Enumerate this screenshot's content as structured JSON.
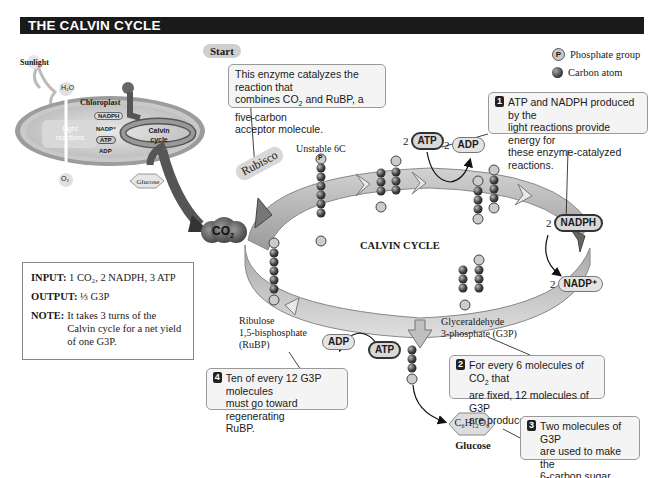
{
  "header": {
    "title": "THE CALVIN CYCLE"
  },
  "legend": {
    "items": [
      {
        "symbol": "P",
        "label": "Phosphate group"
      },
      {
        "symbol": "",
        "label": "Carbon atom"
      }
    ]
  },
  "start_label": "Start",
  "rubisco_label": "Rubisco",
  "center_label": "CALVIN CYCLE",
  "co2_label": "CO",
  "co2_sub": "2",
  "chloroplast_inset": {
    "sunlight": "Sunlight",
    "h2o": "H₂O",
    "o2": "O₂",
    "chloroplast": "Chloroplast",
    "light_reactions": "Light reactions",
    "calvin_cycle": "Calvin cycle",
    "nadph": "NADPH",
    "nadp": "NADP⁺",
    "atp": "ATP",
    "adp": "ADP",
    "glucose": "Glucose"
  },
  "callouts": {
    "rubisco": {
      "line1": "This enzyme catalyzes the reaction that",
      "line2a": "combines CO",
      "line2sub": "2",
      "line2b": " and RuBP, a five-carbon",
      "line3": "acceptor molecule."
    },
    "step1": {
      "num": "1",
      "lines": [
        "ATP and NADPH produced by the",
        "light reactions provide energy for",
        "these enzyme-catalyzed reactions."
      ]
    },
    "step2": {
      "num": "2",
      "line1a": "For every 6 molecules of CO",
      "line1sub": "2",
      "line1b": " that",
      "line2": "are fixed, 12 molecules of G3P",
      "line3": "are produced."
    },
    "step3": {
      "num": "3",
      "lines": [
        "Two molecules of G3P",
        "are used to make the",
        "6-carbon sugar glucose."
      ]
    },
    "step4": {
      "num": "4",
      "lines": [
        "Ten of every 12 G3P molecules",
        "must go toward regenerating",
        "RuBP."
      ]
    }
  },
  "molecules": {
    "unstable": "Unstable 6C",
    "rubp": [
      "Ribulose",
      "1,5-bisphosphate",
      "(RuBP)"
    ],
    "g3p": [
      "Glyceraldehyde",
      "3-phosphate (G3P)"
    ],
    "glucose_formula": "C₆H₁₂O₆",
    "glucose_name": "Glucose"
  },
  "cofactors": {
    "atp_top": {
      "coef": "2",
      "label": "ATP"
    },
    "adp_top": {
      "coef": "2",
      "label": "ADP"
    },
    "nadph": {
      "coef": "2",
      "label": "NADPH"
    },
    "nadp": {
      "coef": "2",
      "label": "NADP⁺"
    },
    "adp_bottom": {
      "label": "ADP"
    },
    "atp_bottom": {
      "label": "ATP"
    }
  },
  "infobox": {
    "input_label": "INPUT:",
    "input_value": "1 CO₂, 2 NADPH, 3 ATP",
    "output_label": "OUTPUT:",
    "output_value": "⅓ G3P",
    "note_label": "NOTE:",
    "note_lines": [
      "It takes 3 turns of the",
      "Calvin cycle for a net yield",
      "of one G3P."
    ]
  }
}
